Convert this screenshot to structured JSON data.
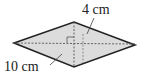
{
  "diagram": {
    "shape": "rhombus",
    "fill_color": "#dcdcdc",
    "stroke_color": "#222222",
    "diagonal_color": "#555555",
    "labels": {
      "short_diagonal": "4 cm",
      "long_diagonal": "10 cm"
    }
  }
}
